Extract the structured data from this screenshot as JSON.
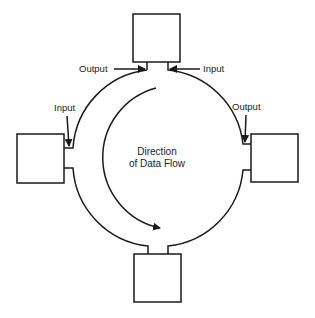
{
  "diagram": {
    "type": "ring-topology",
    "center_label_line1": "Direction",
    "center_label_line2": "of Data Flow",
    "nodes": [
      {
        "id": "top",
        "label": ""
      },
      {
        "id": "right",
        "label": ""
      },
      {
        "id": "bottom",
        "label": ""
      },
      {
        "id": "left",
        "label": ""
      }
    ],
    "labels": {
      "top_output": "Output",
      "top_input": "Input",
      "left_input": "Input",
      "right_output": "Output"
    },
    "flow_direction": "counter-clockwise",
    "colors": {
      "line": "#1a1a1a",
      "background": "#ffffff"
    }
  }
}
